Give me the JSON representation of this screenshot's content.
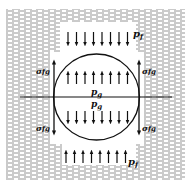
{
  "diagram": {
    "type": "bubble-in-liquid force balance",
    "labels": {
      "pf_top": "p",
      "pf_top_sub": "f",
      "pf_bottom": "p",
      "pf_bottom_sub": "f",
      "pg_upper": "p",
      "pg_upper_sub": "g",
      "pg_lower": "p",
      "pg_lower_sub": "g",
      "sigma_left_top": "σ",
      "sigma_left_top_sub": "fg",
      "sigma_right_top": "σ",
      "sigma_right_top_sub": "fg",
      "sigma_left_bottom": "σ",
      "sigma_left_bottom_sub": "fg",
      "sigma_right_bottom": "σ",
      "sigma_right_bottom_sub": "fg"
    },
    "arrow_rows": {
      "top_down_count": 8,
      "upper_inside_up_count": 8,
      "lower_inside_down_count": 8,
      "bottom_up_count": 8
    },
    "colors": {
      "ink": "#111111",
      "hatch": "#8a8a8a",
      "background": "#ffffff"
    }
  }
}
